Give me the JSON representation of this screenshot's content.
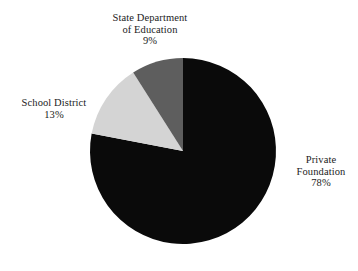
{
  "figure": {
    "background_color": "#ffffff",
    "text_color": "#1b1b1b"
  },
  "chart_data": {
    "type": "pie",
    "title": "",
    "subtitle": "",
    "xlabel": "",
    "ylabel": "",
    "legend_position": "none",
    "grid": false,
    "units": "%",
    "start_angle_deg": 90,
    "direction": "counterclockwise",
    "categories": [
      "Private Foundation",
      "School District",
      "State Department of Education"
    ],
    "values": [
      78,
      13,
      9
    ],
    "colors": [
      "#0a0a0a",
      "#d4d4d4",
      "#5e5e5e"
    ],
    "slices": [
      {
        "label": "Private Foundation",
        "label_line_1": "Private",
        "label_line_2": "Foundation",
        "value": 78,
        "value_text": "78%",
        "color": "#0a0a0a",
        "label_side": "right"
      },
      {
        "label": "School District",
        "label_line_1": "School District",
        "label_line_2": "",
        "value": 13,
        "value_text": "13%",
        "color": "#d4d4d4",
        "label_side": "left"
      },
      {
        "label": "State Department of Education",
        "label_line_1": "State Department",
        "label_line_2": "of Education",
        "value": 9,
        "value_text": "9%",
        "color": "#5e5e5e",
        "label_side": "top"
      }
    ]
  },
  "labels": {
    "state_department": {
      "line1": "State Department",
      "line2": "of Education",
      "value": "9%"
    },
    "school_district": {
      "line1": "School District",
      "value": "13%"
    },
    "private_foundation": {
      "line1": "Private",
      "line2": "Foundation",
      "value": "78%"
    }
  }
}
